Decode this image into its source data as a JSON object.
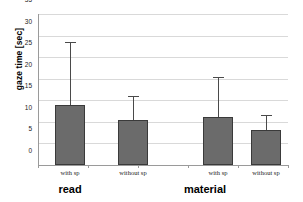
{
  "chart_data": {
    "type": "bar",
    "title": "",
    "xlabel": "",
    "ylabel": "gaze time [sec]",
    "ylim": [
      0,
      35
    ],
    "ytick_step": 5,
    "yticks": [
      0,
      5,
      10,
      15,
      20,
      25,
      30,
      35
    ],
    "grid": true,
    "legend": false,
    "groups": [
      {
        "label": "read"
      },
      {
        "label": "material"
      }
    ],
    "categories": [
      "with sp",
      "without sp",
      "with sp",
      "without sp"
    ],
    "bars": [
      {
        "group": "read",
        "category": "with sp",
        "value": 14.0,
        "error": 14.5
      },
      {
        "group": "read",
        "category": "without sp",
        "value": 10.5,
        "error": 5.5
      },
      {
        "group": "material",
        "category": "with sp",
        "value": 11.2,
        "error": 9.1
      },
      {
        "group": "material",
        "category": "without sp",
        "value": 8.2,
        "error": 3.3
      }
    ],
    "values": [
      14.0,
      10.5,
      11.2,
      8.2
    ],
    "errors": [
      14.5,
      5.5,
      9.1,
      3.3
    ],
    "colors": {
      "bar_fill": "#6b6b6b",
      "bar_border": "#3a3a3a",
      "error_bar": "#4a4a4a",
      "gridline": "#d9d9d9",
      "axis": "#9a9a9a",
      "background": "#ffffff",
      "text": "#111111"
    }
  }
}
